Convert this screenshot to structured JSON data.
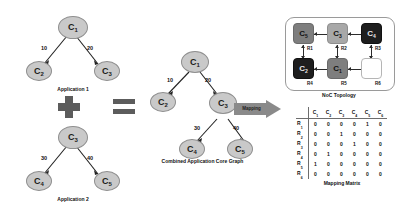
{
  "operators": {
    "plus": "+",
    "equals": "="
  },
  "app1": {
    "caption": "Application 1",
    "nodes": [
      {
        "id": "c1",
        "label": "C",
        "sub": "1"
      },
      {
        "id": "c2",
        "label": "C",
        "sub": "2"
      },
      {
        "id": "c3",
        "label": "C",
        "sub": "3"
      }
    ],
    "edges": [
      {
        "from": "c1",
        "to": "c2",
        "weight": "10"
      },
      {
        "from": "c1",
        "to": "c3",
        "weight": "20"
      }
    ]
  },
  "app2": {
    "caption": "Application 2",
    "nodes": [
      {
        "id": "c3",
        "label": "C",
        "sub": "3"
      },
      {
        "id": "c4",
        "label": "C",
        "sub": "4"
      },
      {
        "id": "c5",
        "label": "C",
        "sub": "5"
      }
    ],
    "edges": [
      {
        "from": "c3",
        "to": "c4",
        "weight": "30"
      },
      {
        "from": "c3",
        "to": "c5",
        "weight": "40"
      }
    ]
  },
  "combined": {
    "caption": "Combined Application Core Graph",
    "nodes": [
      {
        "id": "c1",
        "label": "C",
        "sub": "1"
      },
      {
        "id": "c2",
        "label": "C",
        "sub": "2"
      },
      {
        "id": "c3",
        "label": "C",
        "sub": "3"
      },
      {
        "id": "c4",
        "label": "C",
        "sub": "4"
      },
      {
        "id": "c5",
        "label": "C",
        "sub": "5"
      }
    ],
    "edges": [
      {
        "from": "c1",
        "to": "c2",
        "weight": "10"
      },
      {
        "from": "c1",
        "to": "c3",
        "weight": "20"
      },
      {
        "from": "c3",
        "to": "c4",
        "weight": "30"
      },
      {
        "from": "c3",
        "to": "c5",
        "weight": "40"
      }
    ]
  },
  "mapping_arrow": {
    "label": "Mapping"
  },
  "noc": {
    "caption": "NoC Topology",
    "tiles": [
      {
        "router": "R1",
        "core": "C",
        "core_sub": "5",
        "shade": "mid"
      },
      {
        "router": "R2",
        "core": "C",
        "core_sub": "3",
        "shade": "light"
      },
      {
        "router": "R3",
        "core": "C",
        "core_sub": "4",
        "shade": "dark"
      },
      {
        "router": "R4",
        "core": "C",
        "core_sub": "2",
        "shade": "dark"
      },
      {
        "router": "R5",
        "core": "C",
        "core_sub": "1",
        "shade": "mid"
      },
      {
        "router": "R6",
        "core": "",
        "core_sub": "",
        "shade": "empty"
      }
    ]
  },
  "matrix": {
    "caption": "Mapping Matrix",
    "col_headers": [
      "C1",
      "C2",
      "C3",
      "C4",
      "C5",
      "C6"
    ],
    "col_header_base": [
      "C",
      "C",
      "C",
      "C",
      "C",
      "C"
    ],
    "col_header_sub": [
      "1",
      "2",
      "3",
      "4",
      "5",
      "6"
    ],
    "row_headers": [
      "R1",
      "R2",
      "R3",
      "R4",
      "R5",
      "R6"
    ],
    "row_header_base": [
      "R",
      "R",
      "R",
      "R",
      "R",
      "R"
    ],
    "row_header_sub": [
      "1",
      "2",
      "3",
      "4",
      "5",
      "6"
    ],
    "rows": [
      [
        "0",
        "0",
        "0",
        "0",
        "1",
        "0"
      ],
      [
        "0",
        "0",
        "1",
        "0",
        "0",
        "0"
      ],
      [
        "0",
        "0",
        "0",
        "1",
        "0",
        "0"
      ],
      [
        "0",
        "1",
        "0",
        "0",
        "0",
        "0"
      ],
      [
        "1",
        "0",
        "0",
        "0",
        "0",
        "0"
      ],
      [
        "0",
        "0",
        "0",
        "0",
        "0",
        "0"
      ]
    ]
  },
  "colors": {
    "node_fill": "#c9c9c9",
    "tile_mid": "#7e7e7e",
    "tile_light": "#a8a8a8",
    "tile_dark": "#1e1e1e",
    "arrow": "#8a8a8a",
    "operator": "#5c5c5c"
  }
}
